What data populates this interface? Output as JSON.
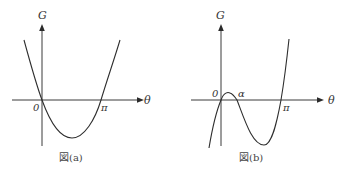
{
  "figures": [
    {
      "id": "a",
      "caption": "図(a)",
      "y_axis_label": "G",
      "x_axis_label": "θ",
      "origin_label": "0",
      "pi_label": "π",
      "curve_type": "parabola",
      "description": "Upward-opening parabola crossing the θ-axis at 0 and π, minimum between them"
    },
    {
      "id": "b",
      "caption": "図(b)",
      "y_axis_label": "G",
      "x_axis_label": "θ",
      "origin_label": "0",
      "alpha_label": "α",
      "pi_label": "π",
      "curve_type": "cubic",
      "description": "Cubic curve crossing the θ-axis at 0, α and π; local maximum between 0 and α, local minimum between α and π"
    }
  ],
  "colors": {
    "line": "#2e2e2e",
    "background": "#ffffff",
    "text": "#333333"
  }
}
